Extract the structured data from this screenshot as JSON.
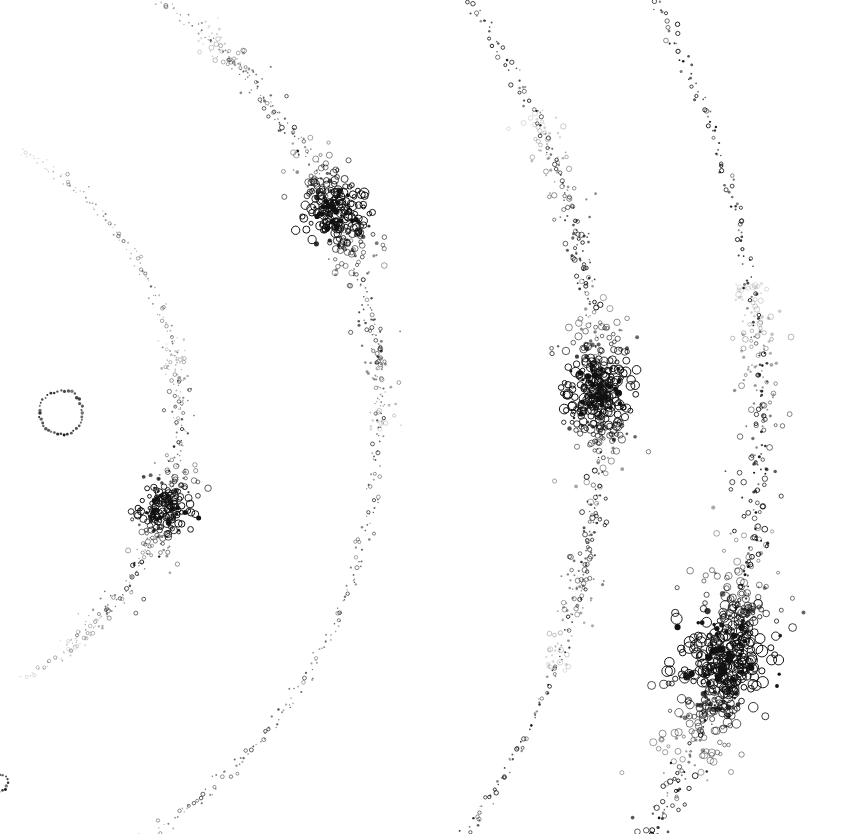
{
  "figure": {
    "background_color": "#ffffff",
    "ink_color": "#111111",
    "width": 859,
    "height": 834,
    "caption": "Four nested arcs of small circles centered off the left edge of the frame, each arc carrying one elongated dense clump of overlapping rings. A small dotted circle sits near the centre-left, and a partial circle is clipped at the lower-left edge."
  },
  "chart_data": {
    "type": "scatter",
    "subtitle": "",
    "xlabel": "",
    "ylabel": "",
    "xlim": [
      0,
      859
    ],
    "ylim": [
      0,
      834
    ],
    "grid": false,
    "legend": "none",
    "axis_visible": false,
    "tick_labels": [],
    "annotations": [],
    "coordinate_note": "All coordinates are in image pixels; y increases downward.",
    "arc_center": {
      "x": -120,
      "y": 415
    },
    "marker_style": {
      "shape": "open-circle",
      "base_radius_px": 1.6,
      "clump_radius_px": 3.4,
      "stroke_width_px": 1.0
    },
    "series": [
      {
        "name": "arc-1-inner",
        "radius": 300,
        "start_angle_deg": -62,
        "end_angle_deg": 62,
        "point_count": 240,
        "opacity": 0.55,
        "size_scale": 0.8,
        "clump": {
          "name": "clump-1",
          "center_angle_deg": 18,
          "angular_half_width_deg": 9.5,
          "peak_count": 210,
          "radial_spread_px": 13,
          "center_x": 268,
          "center_y": 505
        }
      },
      {
        "name": "arc-2",
        "radius": 500,
        "start_angle_deg": -62,
        "end_angle_deg": 62,
        "point_count": 340,
        "opacity": 0.75,
        "size_scale": 0.9,
        "clump": {
          "name": "clump-2",
          "center_angle_deg": -24,
          "angular_half_width_deg": 7.5,
          "peak_count": 260,
          "radial_spread_px": 15,
          "center_x": 390,
          "center_y": 228
        }
      },
      {
        "name": "arc-3",
        "radius": 720,
        "start_angle_deg": -59,
        "end_angle_deg": 58,
        "point_count": 420,
        "opacity": 0.9,
        "size_scale": 1.0,
        "clump": {
          "name": "clump-3",
          "center_angle_deg": -2,
          "angular_half_width_deg": 6.5,
          "peak_count": 330,
          "radial_spread_px": 17,
          "center_x": 620,
          "center_y": 398
        }
      },
      {
        "name": "arc-4-outer",
        "radius": 880,
        "start_angle_deg": -58,
        "end_angle_deg": 57,
        "point_count": 470,
        "opacity": 1.0,
        "size_scale": 1.1,
        "clump": {
          "name": "clump-4",
          "center_angle_deg": 16,
          "angular_half_width_deg": 7.0,
          "peak_count": 470,
          "radial_spread_px": 22,
          "center_x": 793,
          "center_y": 660
        }
      }
    ],
    "extra_markers": [
      {
        "name": "central-dotted-circle",
        "type": "ring-of-dots",
        "center_x": 61,
        "center_y": 413,
        "radius": 22,
        "dot_count": 40,
        "dot_radius_px": 1.3,
        "label": ""
      },
      {
        "name": "edge-clipped-circle",
        "type": "ring-of-dots",
        "center_x": -2,
        "center_y": 783,
        "radius": 9,
        "dot_count": 18,
        "dot_radius_px": 1.2,
        "label": ""
      }
    ]
  },
  "render": {
    "seed": 20240517,
    "jitter_px": 1.6,
    "clump_jitter_px": 3.0
  }
}
